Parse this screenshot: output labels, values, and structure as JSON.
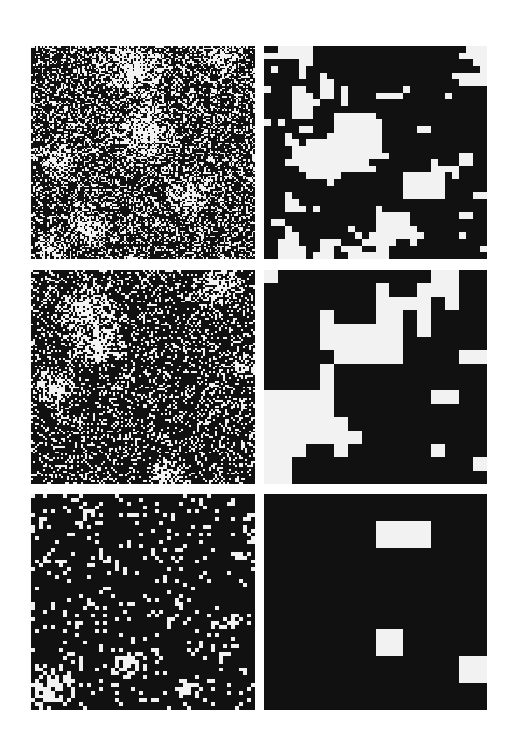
{
  "figure": {
    "colors": {
      "black": "#111111",
      "white": "#f2f2f2",
      "background": "#ffffff"
    },
    "layout": {
      "rows": 3,
      "cols": 2
    }
  },
  "panels": [
    {
      "id": "top-left",
      "row": 0,
      "col": 0,
      "rect": [
        31,
        46,
        224,
        213
      ],
      "grid": 128,
      "type": "noise",
      "white_fraction": 0.3,
      "seed": 11,
      "blobs": [
        [
          0.45,
          0.1,
          0.18
        ],
        [
          0.5,
          0.4,
          0.16
        ],
        [
          0.12,
          0.55,
          0.1
        ],
        [
          0.85,
          0.05,
          0.1
        ],
        [
          0.7,
          0.7,
          0.1
        ],
        [
          0.25,
          0.85,
          0.1
        ],
        [
          0.08,
          0.95,
          0.08
        ]
      ]
    },
    {
      "id": "top-right",
      "row": 0,
      "col": 1,
      "rect": [
        264,
        46,
        223,
        213
      ],
      "grid": 32,
      "type": "bitmap",
      "white_cells": [
        [
          2,
          3,
          4,
          5,
          6,
          29,
          30,
          31
        ],
        [
          0,
          1,
          2,
          3,
          4,
          5,
          6,
          28,
          29,
          30,
          31
        ],
        [
          5,
          6,
          30,
          31
        ],
        [
          1,
          5,
          31
        ],
        [
          5,
          8,
          27,
          28,
          29,
          30,
          31
        ],
        [
          8,
          9,
          28,
          29,
          30,
          31
        ],
        [
          0,
          4,
          5,
          8,
          9,
          11,
          20
        ],
        [
          4,
          5,
          6,
          8,
          9,
          11,
          16,
          17,
          18,
          19,
          26
        ],
        [
          4,
          5,
          6,
          7,
          11
        ],
        [
          4,
          5,
          6
        ],
        [
          4,
          5,
          6,
          10,
          11,
          12,
          13,
          14,
          15
        ],
        [
          0,
          2,
          10,
          11,
          12,
          13,
          14,
          15,
          16
        ],
        [
          5,
          6,
          10,
          11,
          12,
          13,
          14,
          15,
          16,
          22,
          23
        ],
        [
          3,
          9,
          10,
          11,
          12,
          13,
          14,
          15,
          16
        ],
        [
          3,
          4,
          6,
          7,
          8,
          9,
          10,
          11,
          12,
          13,
          14,
          15,
          16
        ],
        [
          4,
          5,
          6,
          7,
          8,
          9,
          10,
          11,
          12,
          13,
          14,
          15,
          16
        ],
        [
          4,
          5,
          6,
          7,
          8,
          9,
          10,
          11,
          12,
          13,
          14,
          15,
          16,
          17,
          28,
          29
        ],
        [
          3,
          4,
          5,
          6,
          7,
          8,
          9,
          10,
          11,
          12,
          13,
          14,
          24,
          28,
          29
        ],
        [
          5,
          6,
          7,
          8,
          9,
          10,
          11,
          12,
          13,
          14,
          15,
          24,
          25,
          26,
          27
        ],
        [
          6,
          7,
          8,
          9,
          10,
          20,
          21,
          22,
          23,
          24,
          25,
          27
        ],
        [
          9,
          20,
          21,
          22,
          23,
          24,
          25
        ],
        [
          20,
          21,
          22,
          23,
          24,
          25
        ],
        [
          3,
          20,
          21,
          22,
          23,
          24,
          25,
          30,
          31
        ],
        [
          3,
          4
        ],
        [
          3,
          4,
          5,
          7,
          16
        ],
        [
          16,
          17,
          18,
          19,
          20,
          28,
          29
        ],
        [
          1,
          2,
          16,
          17,
          18,
          19,
          20
        ],
        [
          3,
          12,
          16,
          17,
          18,
          19,
          20,
          21
        ],
        [
          3,
          4,
          13,
          15,
          16,
          17,
          18,
          19,
          20,
          21,
          22,
          28
        ],
        [
          2,
          3,
          4,
          8,
          9,
          10,
          14,
          15,
          16,
          17,
          18,
          21
        ],
        [
          2,
          3,
          4,
          5,
          8,
          9,
          11,
          12,
          13,
          16,
          17,
          31
        ],
        [
          2,
          3,
          4,
          5,
          7,
          8,
          9,
          12,
          13,
          14,
          15,
          16,
          17
        ]
      ]
    },
    {
      "id": "middle-left",
      "row": 1,
      "col": 0,
      "rect": [
        31,
        270,
        224,
        214
      ],
      "grid": 112,
      "type": "noise",
      "white_fraction": 0.22,
      "seed": 23,
      "blobs": [
        [
          0.25,
          0.2,
          0.14
        ],
        [
          0.3,
          0.35,
          0.12
        ],
        [
          0.85,
          0.08,
          0.1
        ],
        [
          0.1,
          0.55,
          0.09
        ],
        [
          0.6,
          0.95,
          0.08
        ],
        [
          0.95,
          0.45,
          0.06
        ]
      ]
    },
    {
      "id": "middle-right",
      "row": 1,
      "col": 1,
      "rect": [
        264,
        270,
        223,
        214
      ],
      "grid": 16,
      "type": "bitmap",
      "white_cells": [
        [
          0,
          12,
          13
        ],
        [
          8,
          11,
          12,
          13
        ],
        [
          8,
          9,
          10,
          11,
          13
        ],
        [
          4,
          8,
          9,
          11
        ],
        [
          4,
          5,
          6,
          7,
          8,
          9,
          11
        ],
        [
          4,
          5,
          6,
          7,
          8,
          9
        ],
        [
          5,
          6,
          7,
          8,
          9,
          14,
          15
        ],
        [
          4
        ],
        [
          4
        ],
        [
          0,
          1,
          2,
          3,
          4,
          12,
          13
        ],
        [
          0,
          1,
          2,
          3,
          4
        ],
        [
          0,
          1,
          2,
          3,
          4,
          5
        ],
        [
          0,
          1,
          2,
          3,
          4,
          5,
          6
        ],
        [
          0,
          1,
          2,
          5,
          12
        ],
        [
          0,
          1,
          15
        ],
        [
          0,
          1
        ]
      ]
    },
    {
      "id": "bottom-left",
      "row": 2,
      "col": 0,
      "rect": [
        31,
        494,
        224,
        216
      ],
      "grid": 56,
      "type": "noise",
      "white_fraction": 0.12,
      "seed": 37,
      "blobs": [
        [
          0.08,
          0.9,
          0.12
        ],
        [
          0.45,
          0.78,
          0.07
        ],
        [
          0.9,
          0.6,
          0.05
        ],
        [
          0.7,
          0.9,
          0.06
        ]
      ]
    },
    {
      "id": "bottom-right",
      "row": 2,
      "col": 1,
      "rect": [
        264,
        494,
        223,
        216
      ],
      "grid": 8,
      "type": "bitmap",
      "white_cells": [
        [],
        [
          4,
          5
        ],
        [],
        [],
        [],
        [
          4
        ],
        [
          7
        ],
        []
      ]
    }
  ]
}
